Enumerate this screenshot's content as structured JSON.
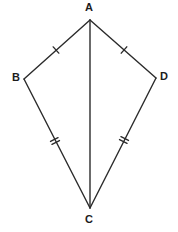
{
  "figure": {
    "shape_name": "kite",
    "background_color": "#ffffff",
    "stroke_color": "#2b2b2b",
    "label_color": "#1c1c1c",
    "stroke_width": 1.4,
    "canvas": {
      "width": 178,
      "height": 232
    }
  },
  "vertices": [
    {
      "id": "A",
      "label": "A",
      "x": 90,
      "y": 20,
      "label_x": 85,
      "label_y": 2
    },
    {
      "id": "B",
      "label": "B",
      "x": 24,
      "y": 79,
      "label_x": 12,
      "label_y": 72
    },
    {
      "id": "D",
      "label": "D",
      "x": 156,
      "y": 78,
      "label_x": 160,
      "label_y": 71
    },
    {
      "id": "C",
      "label": "C",
      "x": 90,
      "y": 208,
      "label_x": 85,
      "label_y": 214
    }
  ],
  "edges": [
    {
      "id": "AB",
      "from": "A",
      "to": "B",
      "x1": 90,
      "y1": 20,
      "x2": 24,
      "y2": 79,
      "tick_count": 1,
      "tick_at": {
        "x": 56,
        "y": 50
      }
    },
    {
      "id": "AD",
      "from": "A",
      "to": "D",
      "x1": 90,
      "y1": 20,
      "x2": 156,
      "y2": 78,
      "tick_count": 1,
      "tick_at": {
        "x": 124,
        "y": 50
      }
    },
    {
      "id": "BC",
      "from": "B",
      "to": "C",
      "x1": 24,
      "y1": 79,
      "x2": 90,
      "y2": 208,
      "tick_count": 2,
      "tick_at": {
        "x": 55,
        "y": 141
      }
    },
    {
      "id": "DC",
      "from": "D",
      "to": "C",
      "x1": 156,
      "y1": 78,
      "x2": 90,
      "y2": 208,
      "tick_count": 2,
      "tick_at": {
        "x": 124,
        "y": 140
      }
    }
  ],
  "diagonals": [
    {
      "id": "AC",
      "from": "A",
      "to": "C",
      "x1": 90,
      "y1": 20,
      "x2": 90,
      "y2": 208,
      "tick_count": 0
    }
  ]
}
